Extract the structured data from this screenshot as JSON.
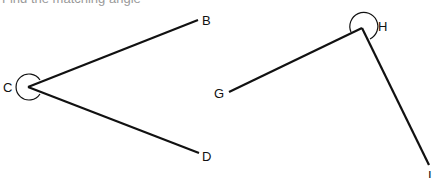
{
  "header": {
    "text": "Find the matching angle"
  },
  "colors": {
    "stroke": "#111111",
    "text": "#111111",
    "background": "#ffffff"
  },
  "angles": [
    {
      "name": "angle-BCD",
      "vertex": {
        "label": "C",
        "x": 28,
        "y": 87
      },
      "arms": [
        {
          "label": "B",
          "x": 198,
          "y": 20
        },
        {
          "label": "D",
          "x": 199,
          "y": 153
        }
      ],
      "marker": "reflex-arc"
    },
    {
      "name": "angle-GHI",
      "vertex": {
        "label": "H",
        "x": 362,
        "y": 28
      },
      "arms": [
        {
          "label": "G",
          "x": 229,
          "y": 92
        },
        {
          "label": "I",
          "x": 429,
          "y": 165
        }
      ],
      "marker": "reflex-arc"
    }
  ],
  "labels": {
    "B": "B",
    "C": "C",
    "D": "D",
    "G": "G",
    "H": "H",
    "I": "I"
  }
}
